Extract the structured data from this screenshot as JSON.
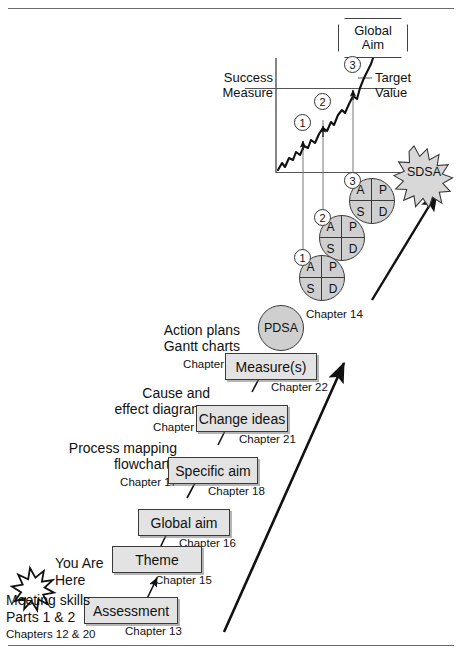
{
  "chart": {
    "global_aim": [
      "Global",
      "Aim"
    ],
    "y_axis_label": [
      "Success",
      "Measure"
    ],
    "target_label": [
      "Target",
      "Value"
    ],
    "run_points": [
      1,
      2,
      3
    ],
    "sdsa_label": "SDSA"
  },
  "pdsa_cycles": [
    {
      "num": "1",
      "quadrants": [
        "A",
        "P",
        "S",
        "D"
      ]
    },
    {
      "num": "2",
      "quadrants": [
        "A",
        "P",
        "S",
        "D"
      ]
    },
    {
      "num": "3",
      "quadrants": [
        "A",
        "P",
        "S",
        "D"
      ]
    }
  ],
  "pdsa_bubble": {
    "label": "PDSA",
    "chapter": "Chapter 14"
  },
  "steps": [
    {
      "label": "Assessment",
      "chapter": "Chapter 13"
    },
    {
      "label": "Theme",
      "chapter": "Chapter 15"
    },
    {
      "label": "Global aim",
      "chapter": "Chapter 16"
    },
    {
      "label": "Specific aim",
      "chapter": "Chapter 18"
    },
    {
      "label": "Change ideas",
      "chapter": "Chapter 21"
    },
    {
      "label": "Measure(s)",
      "chapter": "Chapter 22"
    }
  ],
  "side_notes": [
    {
      "lines": [
        "Process mapping",
        "flowcharts"
      ],
      "chapter": "Chapter 17"
    },
    {
      "lines": [
        "Cause and",
        "effect diagrams"
      ],
      "chapter": "Chapter 19"
    },
    {
      "lines": [
        "Action plans",
        "Gantt charts"
      ],
      "chapter": "Chapter 23"
    }
  ],
  "you_are_here": {
    "lines": [
      "You Are",
      "Here"
    ],
    "meeting": [
      "Meeting skills",
      "Parts 1 & 2"
    ],
    "chapters": "Chapters 12 & 20"
  },
  "colors": {
    "box_fill": "#e3e3e3",
    "circle_fill": "#cfcfcf",
    "burst_fill": "#d8d8d8",
    "ink": "#111111",
    "rule": "#6b6b6b"
  }
}
